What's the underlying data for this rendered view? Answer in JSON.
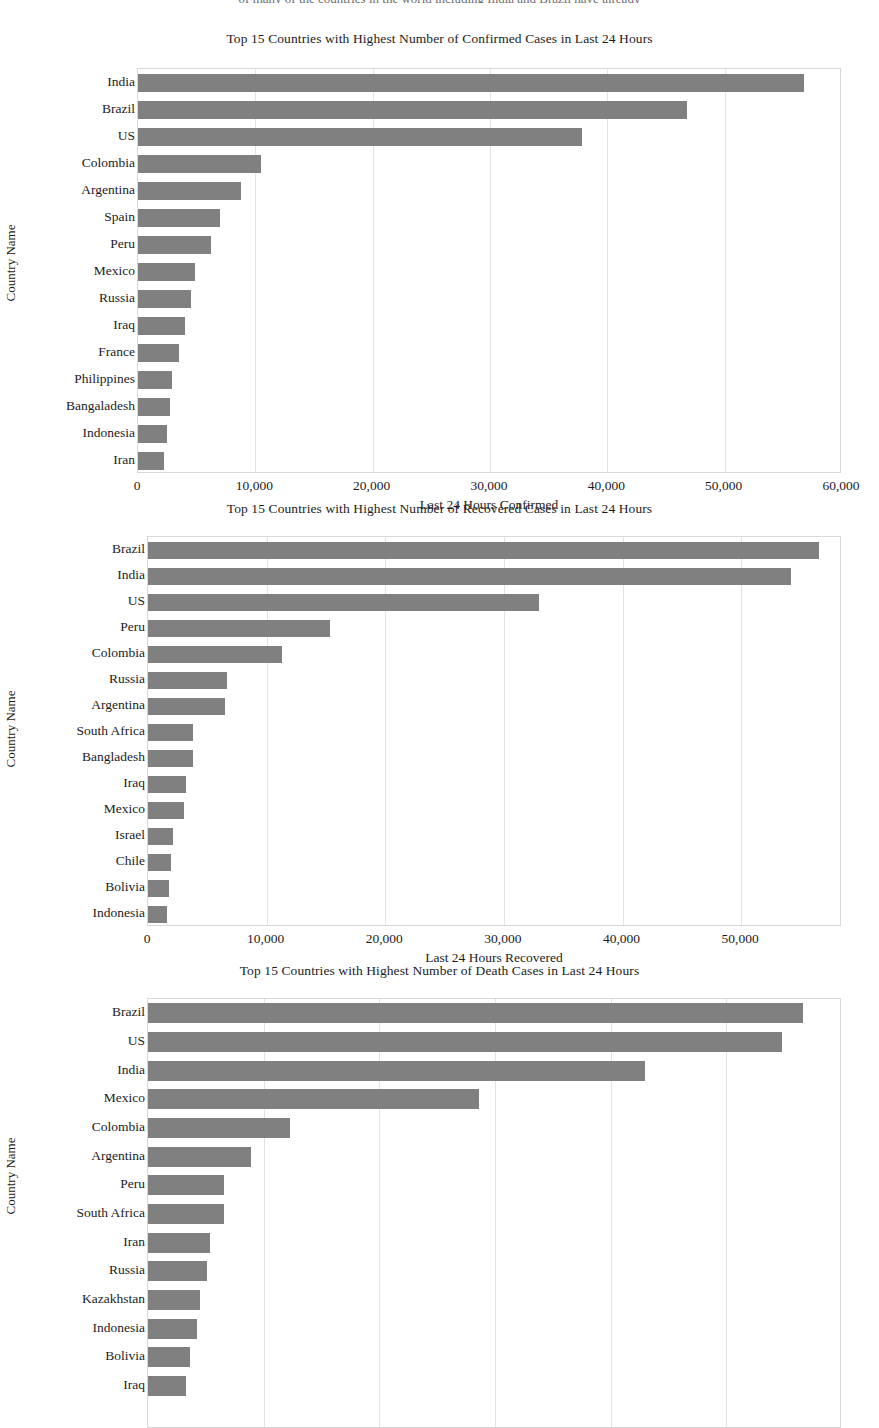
{
  "page": {
    "top_cut_text": "of many of the countries in the world including India and Brazil have already"
  },
  "figures": [
    {
      "id": "confirmed",
      "title": "Top 15 Countries with Highest Number of Confirmed Cases in Last 24 Hours",
      "ylabel": "Country Name",
      "xlabel": "Last 24 Hours Confirmed",
      "xticks": [
        "0",
        "10,000",
        "20,000",
        "30,000",
        "40,000",
        "50,000",
        "60,000"
      ]
    },
    {
      "id": "recovered",
      "title": "Top 15 Countries with Highest Number of Recovered Cases in Last 24 Hours",
      "ylabel": "Country Name",
      "xlabel": "Last 24 Hours Recovered",
      "xticks": [
        "0",
        "10,000",
        "20,000",
        "30,000",
        "40,000",
        "50,000"
      ]
    },
    {
      "id": "deaths",
      "title": "Top 15 Countries with Highest Number of Death Cases in Last 24 Hours",
      "ylabel": "Country Name",
      "xlabel": "",
      "xticks": []
    }
  ],
  "chart_data": [
    {
      "type": "bar",
      "orientation": "horizontal",
      "title": "Top 15 Countries with Highest Number of Confirmed Cases in Last 24 Hours",
      "xlabel": "Last 24 Hours Confirmed",
      "ylabel": "Country Name",
      "xlim": [
        0,
        60000
      ],
      "xticks": [
        0,
        10000,
        20000,
        30000,
        40000,
        50000,
        60000
      ],
      "xticklabels": [
        "0",
        "10,000",
        "20,000",
        "30,000",
        "40,000",
        "50,000",
        "60,000"
      ],
      "grid": true,
      "legend": "none",
      "bar_color": "#808080",
      "categories": [
        "India",
        "Brazil",
        "US",
        "Colombia",
        "Argentina",
        "Spain",
        "Peru",
        "Mexico",
        "Russia",
        "Iraq",
        "France",
        "Philippines",
        "Bangaladesh",
        "Indonesia",
        "Iran"
      ],
      "values": [
        56800,
        46800,
        37800,
        10500,
        8800,
        7000,
        6200,
        4900,
        4500,
        4000,
        3500,
        2900,
        2700,
        2500,
        2200
      ]
    },
    {
      "type": "bar",
      "orientation": "horizontal",
      "title": "Top 15 Countries with Highest Number of Recovered Cases in Last 24 Hours",
      "xlabel": "Last 24 Hours Recovered",
      "ylabel": "Country Name",
      "xlim": [
        0,
        58500
      ],
      "xticks": [
        0,
        10000,
        20000,
        30000,
        40000,
        50000
      ],
      "xticklabels": [
        "0",
        "10,000",
        "20,000",
        "30,000",
        "40,000",
        "50,000"
      ],
      "grid": true,
      "legend": "none",
      "bar_color": "#808080",
      "categories": [
        "Brazil",
        "India",
        "US",
        "Peru",
        "Colombia",
        "Russia",
        "Argentina",
        "South Africa",
        "Bangladesh",
        "Iraq",
        "Mexico",
        "Israel",
        "Chile",
        "Bolivia",
        "Indonesia"
      ],
      "values": [
        56600,
        54200,
        33000,
        15300,
        11300,
        6700,
        6500,
        3800,
        3800,
        3200,
        3000,
        2100,
        1900,
        1800,
        1600
      ]
    },
    {
      "type": "bar",
      "orientation": "horizontal",
      "title": "Top 15 Countries with Highest Number of Death Cases in Last 24 Hours",
      "xlabel": "",
      "ylabel": "Country Name",
      "xlim": [
        0,
        60000
      ],
      "xticks": [],
      "xticklabels": [],
      "grid": true,
      "legend": "none",
      "bar_color": "#808080",
      "note": "x-axis tick labels are cropped off the bottom of the page; values shown are relative bar extents",
      "categories": [
        "Brazil",
        "US",
        "India",
        "Mexico",
        "Colombia",
        "Argentina",
        "Peru",
        "South Africa",
        "Iran",
        "Russia",
        "Kazakhstan",
        "Indonesia",
        "Bolivia",
        "Iraq"
      ],
      "values": [
        56600,
        54800,
        43000,
        28600,
        12300,
        8900,
        6600,
        6600,
        5400,
        5100,
        4500,
        4200,
        3600,
        3300
      ]
    }
  ]
}
